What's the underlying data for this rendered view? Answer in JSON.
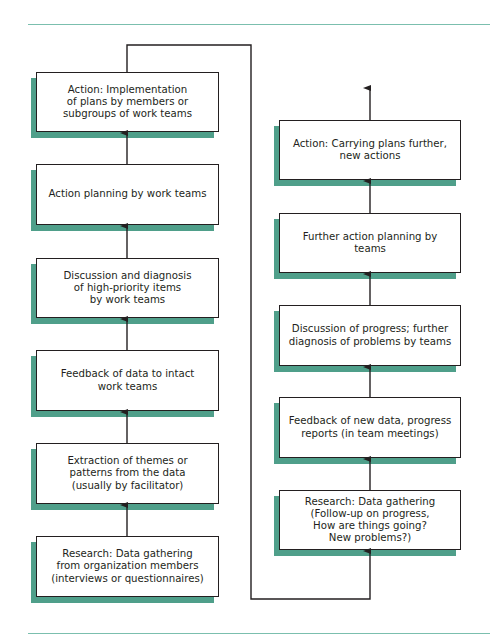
{
  "diagram": {
    "colors": {
      "rule": "#7bbfae",
      "shadow": "#4f9f8a",
      "stroke": "#231f20"
    },
    "left_column": [
      {
        "id": "L1",
        "label": "Action: Implementation\nof plans by members or\nsubgroups of work teams"
      },
      {
        "id": "L2",
        "label": "Action planning by work teams"
      },
      {
        "id": "L3",
        "label": "Discussion and diagnosis\nof high-priority items\nby work teams"
      },
      {
        "id": "L4",
        "label": "Feedback of data to intact\nwork teams"
      },
      {
        "id": "L5",
        "label": "Extraction of themes or\npatterns from the data\n(usually by facilitator)"
      },
      {
        "id": "L6",
        "label": "Research: Data gathering\nfrom organization members\n(interviews or questionnaires)"
      }
    ],
    "right_column": [
      {
        "id": "R1",
        "label": "Action: Carrying plans further,\nnew actions"
      },
      {
        "id": "R2",
        "label": "Further action planning by teams"
      },
      {
        "id": "R3",
        "label": "Discussion of progress; further\ndiagnosis of problems by teams"
      },
      {
        "id": "R4",
        "label": "Feedback of new data, progress\nreports (in team meetings)"
      },
      {
        "id": "R5",
        "label": "Research: Data gathering\n(Follow-up on progress,\nHow are things going?\nNew problems?)"
      }
    ],
    "flow": "L6 → L5 → L4 → L3 → L2 → L1 → (loop connector) → R5 → R4 → R3 → R2 → R1 → continues upward"
  }
}
